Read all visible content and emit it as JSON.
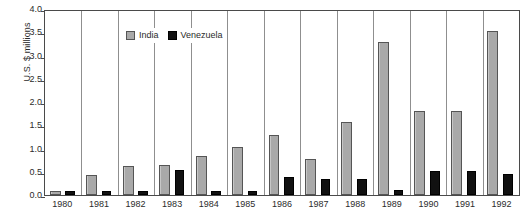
{
  "chart_data": {
    "type": "bar",
    "title": "",
    "subtitle": "",
    "xlabel": "",
    "ylabel": "U.S. $ millions",
    "ylim": [
      0.0,
      4.0
    ],
    "ytick_values": [
      "4.0",
      "3.5",
      "3.0",
      "2.5",
      "2.0",
      "1.5",
      "1.0",
      "0.5",
      "0.0"
    ],
    "grid": "vertical group separators only",
    "legend_position": "top-left inside plot",
    "categories": [
      "1980",
      "1981",
      "1982",
      "1983",
      "1984",
      "1985",
      "1986",
      "1987",
      "1988",
      "1989",
      "1990",
      "1991",
      "1992"
    ],
    "series": [
      {
        "name": "India",
        "color": "#a9a9a9",
        "values": [
          0.08,
          0.43,
          0.63,
          0.65,
          0.83,
          1.04,
          1.28,
          0.78,
          1.57,
          3.3,
          1.8,
          1.8,
          3.53
        ]
      },
      {
        "name": "Venezuela",
        "color": "#111111",
        "values": [
          0.08,
          0.08,
          0.08,
          0.54,
          0.08,
          0.09,
          0.38,
          0.35,
          0.34,
          0.1,
          0.52,
          0.52,
          0.45
        ]
      }
    ]
  },
  "legend": {
    "items": [
      {
        "label": "India",
        "swatch": "india"
      },
      {
        "label": "Venezuela",
        "swatch": "venezuela"
      }
    ]
  },
  "caption": {
    "text": ""
  }
}
